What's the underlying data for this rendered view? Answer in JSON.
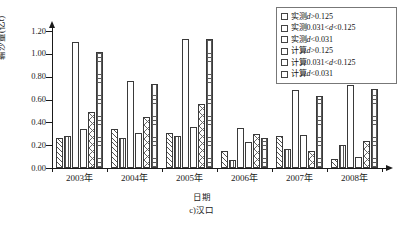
{
  "chart_data": {
    "type": "bar",
    "title": "",
    "subtitle": "",
    "caption": "c)汉口",
    "xlabel": "日期",
    "ylabel": "输沙量(亿t)",
    "categories": [
      "2003年",
      "2004年",
      "2005年",
      "2006年",
      "2007年",
      "2008年"
    ],
    "ylim": [
      0.0,
      1.2
    ],
    "ytick_values": [
      0.0,
      0.2,
      0.4,
      0.6,
      0.8,
      1.0,
      1.2
    ],
    "ytick_labels": [
      "0.00",
      "0.20",
      "0.40",
      "0.60",
      "0.80",
      "1.00",
      "1.20"
    ],
    "grid": false,
    "legend_position": "top-right",
    "series": [
      {
        "name": "实测d>0.125",
        "pattern": "diagonal-hatch",
        "values": [
          0.26,
          0.34,
          0.31,
          0.15,
          0.28,
          0.08
        ]
      },
      {
        "name": "实测0.031<d<0.125",
        "pattern": "vertical-lines",
        "values": [
          0.28,
          0.26,
          0.28,
          0.07,
          0.17,
          0.2
        ]
      },
      {
        "name": "实测d<0.031",
        "pattern": "blank",
        "values": [
          1.1,
          0.76,
          1.13,
          0.35,
          0.68,
          0.73
        ]
      },
      {
        "name": "计算d>0.125",
        "pattern": "blank",
        "values": [
          0.34,
          0.31,
          0.36,
          0.23,
          0.29,
          0.1
        ]
      },
      {
        "name": "计算0.031<d<0.125",
        "pattern": "x-marks",
        "values": [
          0.49,
          0.45,
          0.56,
          0.3,
          0.15,
          0.24
        ]
      },
      {
        "name": "计算d<0.031",
        "pattern": "grid-crosshatch",
        "values": [
          1.02,
          0.74,
          1.13,
          0.26,
          0.63,
          0.69
        ]
      }
    ]
  },
  "legend": {
    "items": [
      {
        "label": "实测d>0.125",
        "prefix": "实测",
        "italic": "d",
        "suffix": ">0.125"
      },
      {
        "label": "实测0.031<d<0.125",
        "prefix": "实测0.031<",
        "italic": "d",
        "suffix": "<0.125"
      },
      {
        "label": "实测d<0.031",
        "prefix": "实测",
        "italic": "d",
        "suffix": "<0.031"
      },
      {
        "label": "计算d>0.125",
        "prefix": "计算",
        "italic": "d",
        "suffix": ">0.125"
      },
      {
        "label": "计算0.031<d<0.125",
        "prefix": "计算0.031<",
        "italic": "d",
        "suffix": "<0.125"
      },
      {
        "label": "计算d<0.031",
        "prefix": "计算",
        "italic": "d",
        "suffix": "<0.031"
      }
    ]
  },
  "colors": {
    "axis": "#1a1a1a",
    "bar_edge": "#3a3a3a",
    "bar_fill": "#ffffff",
    "hatch": "#555555",
    "legend_border": "#777777",
    "background": "#ffffff"
  }
}
